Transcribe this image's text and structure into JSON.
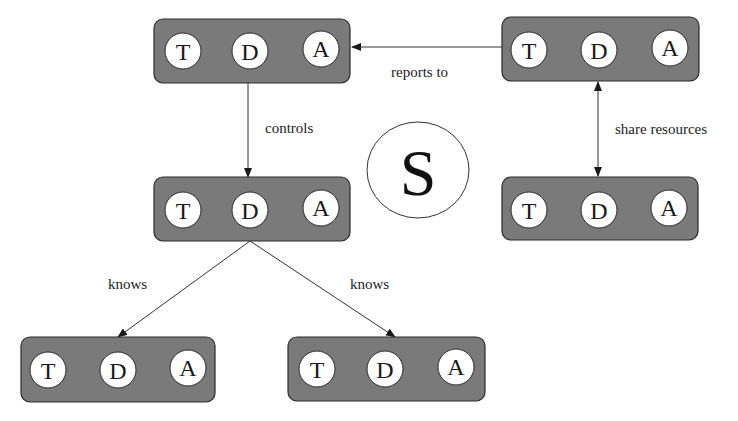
{
  "diagram": {
    "type": "agent-relationship-diagram",
    "center_symbol": {
      "label": "S",
      "cx": 418,
      "cy": 170,
      "rx": 51,
      "ry": 48
    },
    "component_labels": [
      "T",
      "D",
      "A"
    ],
    "nodes": [
      {
        "id": "top-left",
        "x": 154,
        "y": 19,
        "w": 196,
        "h": 64,
        "components": [
          "T",
          "D",
          "A"
        ]
      },
      {
        "id": "top-right",
        "x": 502,
        "y": 17,
        "w": 197,
        "h": 64,
        "components": [
          "T",
          "D",
          "A"
        ]
      },
      {
        "id": "middle-left",
        "x": 154,
        "y": 177,
        "w": 196,
        "h": 64,
        "components": [
          "T",
          "D",
          "A"
        ]
      },
      {
        "id": "middle-right",
        "x": 502,
        "y": 177,
        "w": 196,
        "h": 63,
        "components": [
          "T",
          "D",
          "A"
        ]
      },
      {
        "id": "bottom-left",
        "x": 21,
        "y": 337,
        "w": 194,
        "h": 65,
        "components": [
          "T",
          "D",
          "A"
        ]
      },
      {
        "id": "bottom-right",
        "x": 288,
        "y": 337,
        "w": 197,
        "h": 64,
        "components": [
          "T",
          "D",
          "A"
        ]
      }
    ],
    "edges": [
      {
        "from": "top-right",
        "to": "top-left",
        "label": "reports to",
        "direction": "forward"
      },
      {
        "from": "top-left",
        "to": "middle-left",
        "label": "controls",
        "direction": "forward"
      },
      {
        "from": "top-right",
        "to": "middle-right",
        "label": "share resources",
        "direction": "both"
      },
      {
        "from": "middle-left",
        "to": "bottom-left",
        "label": "knows",
        "direction": "forward"
      },
      {
        "from": "middle-left",
        "to": "bottom-right",
        "label": "knows",
        "direction": "forward"
      }
    ],
    "colors": {
      "box_fill": "#7a7a7a",
      "box_stroke": "#2a2a2a",
      "circle_fill": "#ffffff",
      "line": "#333333",
      "background": "#ffffff"
    }
  },
  "labels": {
    "reports_to": "reports to",
    "controls": "controls",
    "share_resources": "share resources",
    "knows_left": "knows",
    "knows_right": "knows",
    "s": "S",
    "t": "T",
    "d": "D",
    "a": "A"
  }
}
